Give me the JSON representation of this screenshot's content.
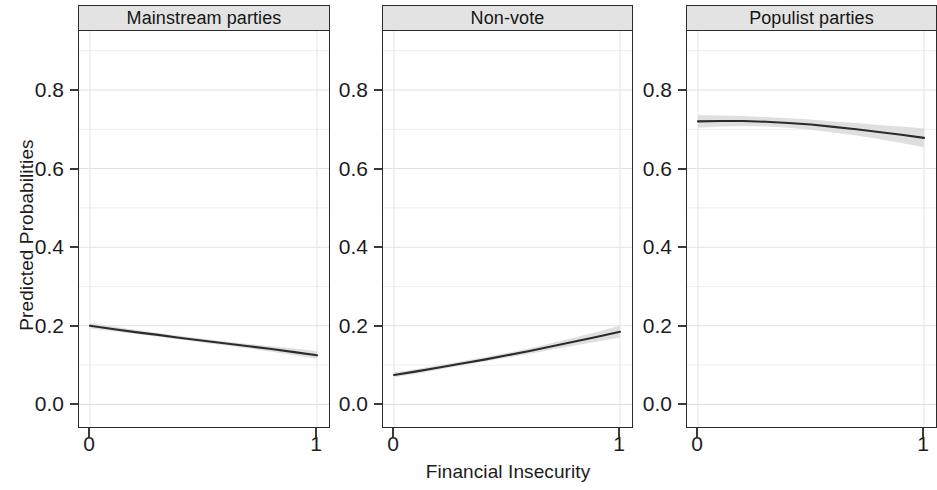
{
  "chart_data": {
    "type": "line",
    "title": "",
    "xlabel": "Financial Insecurity",
    "ylabel": "Predicted Probabilities",
    "xlim": [
      0,
      1
    ],
    "ylim": [
      -0.06,
      0.95
    ],
    "x_ticks": [
      "0",
      "1"
    ],
    "x_tick_values": [
      0,
      1
    ],
    "y_ticks": [
      "0.0",
      "0.2",
      "0.4",
      "0.6",
      "0.8"
    ],
    "y_tick_values": [
      0.0,
      0.2,
      0.4,
      0.6,
      0.8
    ],
    "grid": true,
    "grid_minor_step": 0.1,
    "legend": "none",
    "facet_layout": "1x3",
    "line_color": "#2b2b2b",
    "band_color": "#d9d9d9",
    "strip_bg_color": "#e3e3e3",
    "panels": [
      {
        "label": "Mainstream parties",
        "x": [
          0.0,
          0.1,
          0.2,
          0.3,
          0.4,
          0.5,
          0.6,
          0.7,
          0.8,
          0.9,
          1.0
        ],
        "y": [
          0.2,
          0.192,
          0.184,
          0.177,
          0.169,
          0.162,
          0.155,
          0.148,
          0.141,
          0.133,
          0.125
        ],
        "ci_low": [
          0.193,
          0.186,
          0.179,
          0.172,
          0.165,
          0.157,
          0.15,
          0.142,
          0.134,
          0.125,
          0.116
        ],
        "ci_high": [
          0.207,
          0.198,
          0.19,
          0.182,
          0.174,
          0.167,
          0.16,
          0.154,
          0.148,
          0.142,
          0.135
        ]
      },
      {
        "label": "Non-vote",
        "x": [
          0.0,
          0.1,
          0.2,
          0.3,
          0.4,
          0.5,
          0.6,
          0.7,
          0.8,
          0.9,
          1.0
        ],
        "y": [
          0.075,
          0.084,
          0.094,
          0.104,
          0.114,
          0.125,
          0.136,
          0.148,
          0.16,
          0.172,
          0.185
        ],
        "ci_low": [
          0.069,
          0.078,
          0.089,
          0.099,
          0.109,
          0.119,
          0.129,
          0.14,
          0.15,
          0.16,
          0.17
        ],
        "ci_high": [
          0.081,
          0.09,
          0.1,
          0.11,
          0.12,
          0.131,
          0.143,
          0.156,
          0.17,
          0.185,
          0.201
        ]
      },
      {
        "label": "Populist parties",
        "x": [
          0.0,
          0.1,
          0.2,
          0.3,
          0.4,
          0.5,
          0.6,
          0.7,
          0.8,
          0.9,
          1.0
        ],
        "y": [
          0.72,
          0.721,
          0.721,
          0.719,
          0.716,
          0.712,
          0.706,
          0.7,
          0.693,
          0.686,
          0.678
        ],
        "ci_low": [
          0.704,
          0.707,
          0.708,
          0.707,
          0.704,
          0.699,
          0.692,
          0.684,
          0.675,
          0.665,
          0.654
        ],
        "ci_high": [
          0.736,
          0.735,
          0.734,
          0.731,
          0.728,
          0.725,
          0.72,
          0.716,
          0.711,
          0.707,
          0.702
        ]
      }
    ]
  },
  "axes": {
    "y_title": "Predicted Probabilities",
    "x_title": "Financial Insecurity",
    "y_tick_labels": [
      "0.8",
      "0.6",
      "0.4",
      "0.2",
      "0.0"
    ],
    "x_tick_labels": [
      "0",
      "1"
    ]
  },
  "panels": {
    "p0": {
      "title": "Mainstream parties"
    },
    "p1": {
      "title": "Non-vote"
    },
    "p2": {
      "title": "Populist parties"
    }
  }
}
